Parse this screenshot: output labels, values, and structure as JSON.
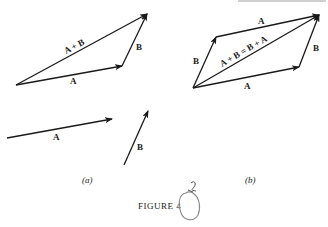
{
  "figure": {
    "caption": "FIGURE 4",
    "header_fragment": "",
    "handwritten_annotation": "2",
    "colors": {
      "ink": "#1a1a1a",
      "pencil": "#8a8a8a",
      "background": "#ffffff"
    }
  },
  "panel_a": {
    "label": "(a)",
    "triangle": {
      "vectors": [
        {
          "name": "A",
          "label": "A"
        },
        {
          "name": "B",
          "label": "B"
        },
        {
          "name": "A+B",
          "label": "A + B"
        }
      ]
    },
    "separate_vectors": [
      {
        "name": "A",
        "label": "A"
      },
      {
        "name": "B",
        "label": "B"
      }
    ]
  },
  "panel_b": {
    "label": "(b)",
    "parallelogram": {
      "vectors": [
        {
          "name": "A-top",
          "label": "A"
        },
        {
          "name": "B-left",
          "label": "B"
        },
        {
          "name": "B-right",
          "label": "B"
        },
        {
          "name": "A-bottom",
          "label": "A"
        },
        {
          "name": "diagonal",
          "label": "A + B = B + A"
        }
      ]
    }
  }
}
